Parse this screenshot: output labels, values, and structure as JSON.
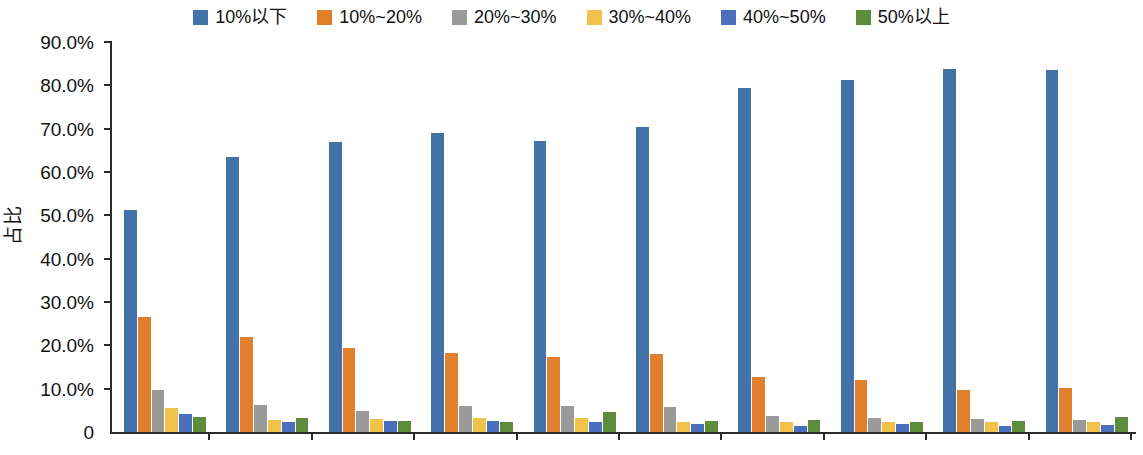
{
  "chart_data": {
    "type": "bar",
    "title": "",
    "subtitle": "",
    "xlabel": "",
    "ylabel": "占比",
    "ylim": [
      0,
      90
    ],
    "ytick_labels": [
      "90.0%",
      "80.0%",
      "70.0%",
      "60.0%",
      "50.0%",
      "40.0%",
      "30.0%",
      "20.0%",
      "10.0%",
      "0"
    ],
    "ytick_values": [
      90,
      80,
      70,
      60,
      50,
      40,
      30,
      20,
      10,
      0
    ],
    "grid": false,
    "legend_position": "top-center",
    "categories": [
      "2014年",
      "2015年",
      "2016年",
      "2017年",
      "2018年",
      "2019年",
      "2020年",
      "2021年",
      "2022年",
      "2023年"
    ],
    "series": [
      {
        "name": "10%以下",
        "color": "#4472a8",
        "values": [
          51.2,
          63.5,
          67.0,
          68.9,
          67.2,
          70.5,
          79.4,
          81.3,
          83.8,
          83.5
        ]
      },
      {
        "name": "10%~20%",
        "color": "#e0802c",
        "values": [
          26.5,
          22.0,
          19.5,
          18.3,
          17.2,
          18.0,
          12.7,
          12.0,
          9.8,
          10.2
        ]
      },
      {
        "name": "20%~30%",
        "color": "#9a9a9a",
        "values": [
          9.6,
          6.3,
          4.9,
          5.9,
          6.0,
          5.7,
          3.8,
          3.2,
          3.0,
          2.7
        ]
      },
      {
        "name": "30%~40%",
        "color": "#f0c24a",
        "values": [
          5.5,
          2.8,
          3.0,
          3.3,
          3.3,
          2.4,
          2.2,
          2.2,
          2.2,
          2.2
        ]
      },
      {
        "name": "40%~50%",
        "color": "#4a6fbd",
        "values": [
          4.2,
          2.2,
          2.6,
          2.5,
          2.4,
          1.9,
          1.5,
          1.8,
          1.5,
          1.6
        ]
      },
      {
        "name": "50%以上",
        "color": "#5c8c3c",
        "values": [
          3.5,
          3.3,
          2.6,
          2.4,
          4.7,
          2.6,
          2.8,
          2.4,
          2.6,
          3.5
        ]
      }
    ]
  }
}
